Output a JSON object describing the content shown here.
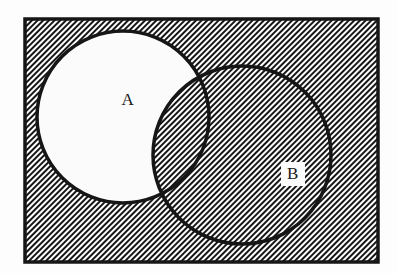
{
  "diagram": {
    "universe_label": "",
    "sets": [
      {
        "id": "A",
        "label": "A",
        "label_x": 128,
        "label_y": 101,
        "cx": 123,
        "cy": 117,
        "r": 86,
        "shaded": false
      },
      {
        "id": "B",
        "label": "B",
        "label_x": 293,
        "label_y": 175,
        "cx": 242,
        "cy": 155,
        "r": 89,
        "shaded": true
      }
    ],
    "universe": {
      "x": 25,
      "y": 19,
      "width": 353,
      "height": 243,
      "shaded": true
    },
    "shaded_region_description": "complement of A minus B",
    "unshaded_region_description": "A minus B",
    "colors": {
      "ink": "#161616",
      "page_background": "#fdfdfd",
      "unshaded_fill": "#fbfbfb",
      "hatch_line": "#161616",
      "hatch_background": "#ffffff"
    },
    "hatch": {
      "angle_degrees": 45,
      "spacing_px": 4,
      "line_width_px": 2
    },
    "stroke_widths": {
      "rectangle_border": 3.5,
      "circle_outline": 3.5
    }
  }
}
